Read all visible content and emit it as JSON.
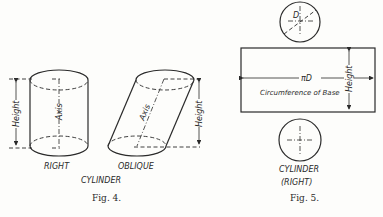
{
  "fig4": {
    "caption": "Fig. 4.",
    "title": "CYLINDER",
    "right": {
      "label": "RIGHT",
      "axis_label": "Axis",
      "height_label": "Height"
    },
    "oblique": {
      "label": "OBLIQUE",
      "axis_label": "Axis",
      "height_label": "Height"
    }
  },
  "fig5": {
    "caption": "Fig. 5.",
    "title_line1": "CYLINDER",
    "title_line2": "(RIGHT)",
    "diameter_label": "D",
    "length_label": "πD",
    "rect_label": "Circumference of Base",
    "height_label": "Height"
  },
  "colors": {
    "ink": "#2a2a2a",
    "paper": "#fdfdfb"
  }
}
